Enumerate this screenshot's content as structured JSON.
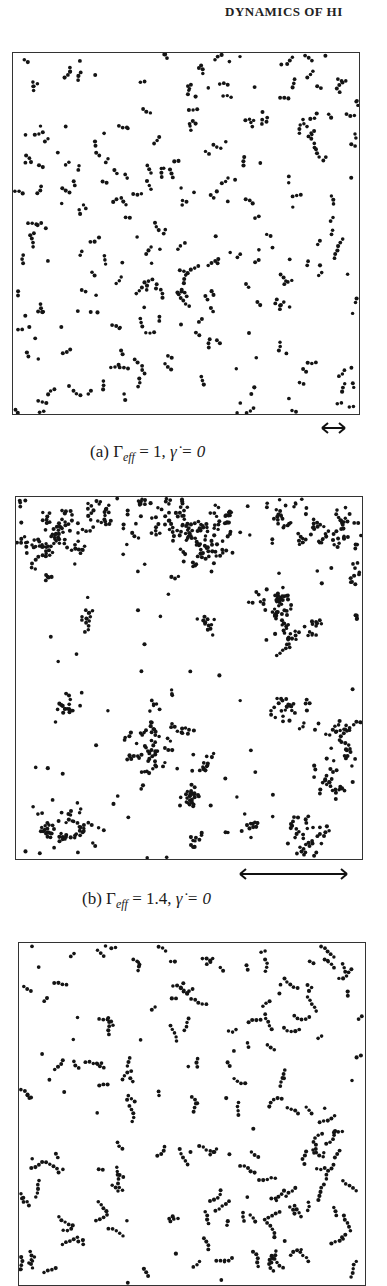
{
  "header": {
    "running_head": "DYNAMICS OF HI"
  },
  "figure": {
    "panels": [
      {
        "id": "a",
        "caption_label": "(a)",
        "caption_param": "Γ",
        "caption_sub": "eff",
        "caption_rest": " = 1, ",
        "caption_rate": "γ̇ = 0",
        "box": {
          "left": 12,
          "top": 52,
          "width": 346,
          "height": 361
        },
        "arrow": {
          "x1": 322,
          "x2": 345,
          "y": 428
        },
        "caption_pos": {
          "left": 90,
          "top": 442
        },
        "particles": {
          "mode": "uniform",
          "count": 520,
          "seed": 11,
          "chain": 3
        }
      },
      {
        "id": "b",
        "caption_label": "(b)",
        "caption_param": "Γ",
        "caption_sub": "eff",
        "caption_rest": " = 1.4, ",
        "caption_rate": "γ̇ = 0",
        "box": {
          "left": 15,
          "top": 496,
          "width": 346,
          "height": 362
        },
        "arrow": {
          "x1": 240,
          "x2": 347,
          "y": 874
        },
        "caption_pos": {
          "left": 82,
          "top": 889
        },
        "particles": {
          "mode": "clusters",
          "seed": 7,
          "background": 70,
          "clusters": [
            [
              30,
              45,
              22,
              70
            ],
            [
              55,
              30,
              14,
              35
            ],
            [
              80,
              15,
              12,
              25
            ],
            [
              130,
              20,
              18,
              40
            ],
            [
              170,
              30,
              20,
              55
            ],
            [
              190,
              55,
              14,
              40
            ],
            [
              210,
              25,
              12,
              25
            ],
            [
              275,
              20,
              20,
              50
            ],
            [
              320,
              35,
              16,
              45
            ],
            [
              340,
              75,
              6,
              12
            ],
            [
              70,
              120,
              6,
              14
            ],
            [
              195,
              130,
              6,
              12
            ],
            [
              255,
              110,
              14,
              45
            ],
            [
              270,
              140,
              10,
              25
            ],
            [
              300,
              125,
              8,
              12
            ],
            [
              345,
              120,
              6,
              8
            ],
            [
              55,
              210,
              8,
              18
            ],
            [
              140,
              235,
              20,
              60
            ],
            [
              135,
              270,
              10,
              18
            ],
            [
              190,
              265,
              5,
              12
            ],
            [
              270,
              210,
              12,
              30
            ],
            [
              330,
              255,
              18,
              50
            ],
            [
              320,
              290,
              10,
              16
            ],
            [
              50,
              330,
              18,
              60
            ],
            [
              175,
              300,
              8,
              25
            ],
            [
              180,
              340,
              5,
              10
            ],
            [
              230,
              330,
              8,
              12
            ],
            [
              300,
              345,
              14,
              35
            ],
            [
              280,
              330,
              6,
              12
            ],
            [
              345,
              350,
              5,
              8
            ]
          ]
        }
      },
      {
        "id": "c",
        "box": {
          "left": 18,
          "top": 942,
          "width": 346,
          "height": 342
        },
        "particles": {
          "mode": "uniform",
          "count": 560,
          "seed": 23,
          "chain": 5
        }
      }
    ]
  }
}
